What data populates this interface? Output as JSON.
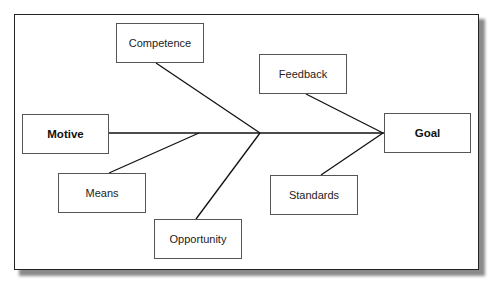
{
  "diagram": {
    "type": "fishbone",
    "head": {
      "label": "Goal"
    },
    "tail": {
      "label": "Motive"
    },
    "causes_upper": [
      {
        "label": "Competence"
      },
      {
        "label": "Feedback"
      }
    ],
    "causes_lower": [
      {
        "label": "Means"
      },
      {
        "label": "Opportunity"
      },
      {
        "label": "Standards"
      }
    ],
    "colors": {
      "line": "#111111",
      "box_border": "#555555",
      "frame_border": "#222222",
      "shadow": "#8a8a8a"
    }
  }
}
